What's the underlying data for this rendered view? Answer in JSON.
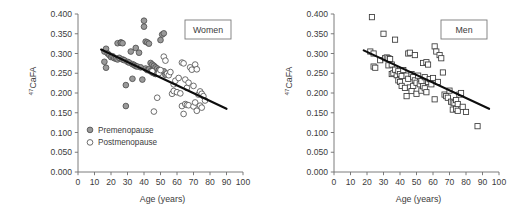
{
  "figure": {
    "title": "",
    "panel_count": 2
  },
  "chart_data": [
    {
      "type": "scatter",
      "panel_id": "women",
      "title": "Women",
      "xlabel": "Age (years)",
      "ylabel": "47CaFA",
      "ylabel_superscript": "47",
      "ylabel_base": "CaFA",
      "xlim": [
        0,
        100
      ],
      "ylim": [
        0.0,
        0.4
      ],
      "xticks": [
        0,
        10,
        20,
        30,
        40,
        50,
        60,
        70,
        80,
        90,
        100
      ],
      "xtick_labels": [
        "0",
        "10",
        "20",
        "30",
        "40",
        "50",
        "60",
        "70",
        "80",
        "90",
        "100"
      ],
      "yticks": [
        0.0,
        0.05,
        0.1,
        0.15,
        0.2,
        0.25,
        0.3,
        0.35,
        0.4
      ],
      "ytick_labels": [
        "0.000",
        "0.050",
        "0.100",
        "0.150",
        "0.200",
        "0.250",
        "0.300",
        "0.350",
        "0.400"
      ],
      "grid": false,
      "legend_position": "lower-left-inside",
      "legend": [
        {
          "label": "Premenopause",
          "marker": "filled-circle",
          "color": "#9a9a9a"
        },
        {
          "label": "Postmenopause",
          "marker": "open-circle",
          "color": "#ffffff"
        }
      ],
      "trendline": {
        "x": [
          14,
          90
        ],
        "y": [
          0.31,
          0.16
        ],
        "color": "#0d0d0d"
      },
      "series": [
        {
          "name": "Premenopause",
          "marker": "filled-circle",
          "points": [
            [
              16,
              0.305
            ],
            [
              16,
              0.279
            ],
            [
              17,
              0.312
            ],
            [
              17,
              0.264
            ],
            [
              18,
              0.3
            ],
            [
              19,
              0.296
            ],
            [
              20,
              0.291
            ],
            [
              21,
              0.293
            ],
            [
              22,
              0.288
            ],
            [
              23,
              0.287
            ],
            [
              24,
              0.326
            ],
            [
              24,
              0.285
            ],
            [
              25,
              0.289
            ],
            [
              26,
              0.328
            ],
            [
              26,
              0.327
            ],
            [
              27,
              0.326
            ],
            [
              27,
              0.285
            ],
            [
              28,
              0.283
            ],
            [
              29,
              0.22
            ],
            [
              29,
              0.167
            ],
            [
              30,
              0.279
            ],
            [
              31,
              0.277
            ],
            [
              32,
              0.305
            ],
            [
              33,
              0.273
            ],
            [
              33,
              0.236
            ],
            [
              34,
              0.271
            ],
            [
              35,
              0.314
            ],
            [
              35,
              0.268
            ],
            [
              36,
              0.267
            ],
            [
              37,
              0.302
            ],
            [
              38,
              0.265
            ],
            [
              39,
              0.234
            ],
            [
              40,
              0.383
            ],
            [
              40,
              0.368
            ],
            [
              41,
              0.33
            ],
            [
              41,
              0.262
            ],
            [
              42,
              0.328
            ],
            [
              42,
              0.258
            ],
            [
              43,
              0.325
            ],
            [
              43,
              0.26
            ],
            [
              44,
              0.276
            ],
            [
              44,
              0.255
            ],
            [
              45,
              0.272
            ],
            [
              45,
              0.252
            ],
            [
              46,
              0.269
            ],
            [
              46,
              0.25
            ],
            [
              47,
              0.265
            ],
            [
              47,
              0.248
            ],
            [
              48,
              0.262
            ],
            [
              49,
              0.258
            ],
            [
              50,
              0.334
            ],
            [
              51,
              0.348
            ],
            [
              52,
              0.351
            ],
            [
              52,
              0.255
            ],
            [
              53,
              0.246
            ]
          ]
        },
        {
          "name": "Postmenopause",
          "marker": "open-circle",
          "points": [
            [
              45,
              0.255
            ],
            [
              46,
              0.153
            ],
            [
              48,
              0.188
            ],
            [
              49,
              0.25
            ],
            [
              50,
              0.258
            ],
            [
              52,
              0.292
            ],
            [
              53,
              0.282
            ],
            [
              54,
              0.249
            ],
            [
              55,
              0.245
            ],
            [
              56,
              0.253
            ],
            [
              57,
              0.198
            ],
            [
              58,
              0.222
            ],
            [
              58,
              0.205
            ],
            [
              59,
              0.231
            ],
            [
              60,
              0.202
            ],
            [
              61,
              0.238
            ],
            [
              62,
              0.199
            ],
            [
              63,
              0.277
            ],
            [
              63,
              0.167
            ],
            [
              64,
              0.275
            ],
            [
              64,
              0.147
            ],
            [
              65,
              0.234
            ],
            [
              65,
              0.172
            ],
            [
              66,
              0.213
            ],
            [
              66,
              0.17
            ],
            [
              67,
              0.226
            ],
            [
              67,
              0.169
            ],
            [
              68,
              0.265
            ],
            [
              69,
              0.259
            ],
            [
              70,
              0.218
            ],
            [
              70,
              0.166
            ],
            [
              71,
              0.272
            ],
            [
              71,
              0.176
            ],
            [
              72,
              0.26
            ],
            [
              72,
              0.155
            ],
            [
              73,
              0.196
            ],
            [
              74,
              0.204
            ],
            [
              74,
              0.168
            ],
            [
              75,
              0.198
            ],
            [
              75,
              0.163
            ],
            [
              76,
              0.192
            ],
            [
              77,
              0.181
            ]
          ]
        }
      ]
    },
    {
      "type": "scatter",
      "panel_id": "men",
      "title": "Men",
      "xlabel": "Age (years)",
      "ylabel": "47CaFA",
      "ylabel_superscript": "47",
      "ylabel_base": "CaFA",
      "xlim": [
        0,
        100
      ],
      "ylim": [
        0.0,
        0.4
      ],
      "xticks": [
        0,
        10,
        20,
        30,
        40,
        50,
        60,
        70,
        80,
        90,
        100
      ],
      "xtick_labels": [
        "0",
        "10",
        "20",
        "30",
        "40",
        "50",
        "60",
        "70",
        "80",
        "90",
        "100"
      ],
      "yticks": [
        0.0,
        0.05,
        0.1,
        0.15,
        0.2,
        0.25,
        0.3,
        0.35,
        0.4
      ],
      "ytick_labels": [
        "0.000",
        "0.050",
        "0.100",
        "0.150",
        "0.200",
        "0.250",
        "0.300",
        "0.350",
        "0.400"
      ],
      "grid": false,
      "legend_position": "none",
      "legend": [],
      "trendline": {
        "x": [
          18,
          94
        ],
        "y": [
          0.308,
          0.16
        ],
        "color": "#0d0d0d"
      },
      "series": [
        {
          "name": "Men",
          "marker": "open-square",
          "points": [
            [
              22,
              0.305
            ],
            [
              23,
              0.392
            ],
            [
              24,
              0.3
            ],
            [
              24,
              0.267
            ],
            [
              25,
              0.264
            ],
            [
              28,
              0.283
            ],
            [
              30,
              0.35
            ],
            [
              31,
              0.288
            ],
            [
              32,
              0.29
            ],
            [
              33,
              0.288
            ],
            [
              33,
              0.27
            ],
            [
              34,
              0.286
            ],
            [
              35,
              0.272
            ],
            [
              35,
              0.248
            ],
            [
              36,
              0.25
            ],
            [
              37,
              0.335
            ],
            [
              37,
              0.259
            ],
            [
              38,
              0.245
            ],
            [
              39,
              0.255
            ],
            [
              39,
              0.232
            ],
            [
              40,
              0.248
            ],
            [
              40,
              0.228
            ],
            [
              41,
              0.243
            ],
            [
              41,
              0.218
            ],
            [
              42,
              0.258
            ],
            [
              43,
              0.213
            ],
            [
              44,
              0.244
            ],
            [
              44,
              0.192
            ],
            [
              45,
              0.3
            ],
            [
              45,
              0.236
            ],
            [
              46,
              0.302
            ],
            [
              46,
              0.214
            ],
            [
              47,
              0.248
            ],
            [
              47,
              0.205
            ],
            [
              48,
              0.24
            ],
            [
              48,
              0.218
            ],
            [
              49,
              0.296
            ],
            [
              49,
              0.232
            ],
            [
              50,
              0.226
            ],
            [
              50,
              0.198
            ],
            [
              51,
              0.244
            ],
            [
              52,
              0.222
            ],
            [
              53,
              0.23
            ],
            [
              53,
              0.206
            ],
            [
              54,
              0.276
            ],
            [
              54,
              0.217
            ],
            [
              55,
              0.24
            ],
            [
              55,
              0.212
            ],
            [
              56,
              0.278
            ],
            [
              56,
              0.202
            ],
            [
              57,
              0.272
            ],
            [
              57,
              0.228
            ],
            [
              58,
              0.235
            ],
            [
              59,
              0.222
            ],
            [
              60,
              0.238
            ],
            [
              61,
              0.318
            ],
            [
              61,
              0.184
            ],
            [
              62,
              0.305
            ],
            [
              63,
              0.228
            ],
            [
              64,
              0.296
            ],
            [
              65,
              0.288
            ],
            [
              66,
              0.252
            ],
            [
              67,
              0.196
            ],
            [
              68,
              0.192
            ],
            [
              69,
              0.188
            ],
            [
              70,
              0.206
            ],
            [
              71,
              0.178
            ],
            [
              72,
              0.176
            ],
            [
              72,
              0.158
            ],
            [
              73,
              0.174
            ],
            [
              74,
              0.182
            ],
            [
              74,
              0.16
            ],
            [
              75,
              0.172
            ],
            [
              75,
              0.155
            ],
            [
              76,
              0.196
            ],
            [
              77,
              0.2
            ],
            [
              78,
              0.165
            ],
            [
              80,
              0.152
            ],
            [
              87,
              0.116
            ]
          ]
        }
      ]
    }
  ]
}
